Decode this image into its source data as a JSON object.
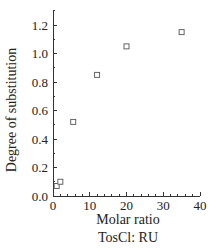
{
  "chart_data": {
    "type": "scatter",
    "title": "",
    "xlabel": "Molar ratio",
    "xlabel_line2": "TosCl: RU",
    "ylabel": "Degree of substitution",
    "xlim": [
      0,
      40
    ],
    "ylim": [
      0.0,
      1.3
    ],
    "x_ticks": [
      0,
      10,
      20,
      30,
      40
    ],
    "x_tick_labels": [
      "0",
      "10",
      "20",
      "30",
      "40"
    ],
    "y_ticks": [
      0.0,
      0.2,
      0.4,
      0.6,
      0.8,
      1.0,
      1.2
    ],
    "y_tick_labels": [
      "0.0",
      "0.2",
      "0.4",
      "0.6",
      "0.8",
      "1.0",
      "1.2"
    ],
    "grid": false,
    "legend": null,
    "marker": "open-square",
    "series": [
      {
        "name": "Degree of substitution",
        "x": [
          1,
          2,
          5.5,
          12,
          20,
          35
        ],
        "y": [
          0.07,
          0.1,
          0.52,
          0.85,
          1.05,
          1.15
        ]
      }
    ]
  }
}
